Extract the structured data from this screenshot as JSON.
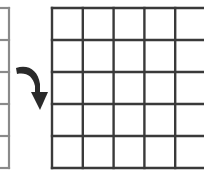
{
  "diagram": {
    "source_grid": {
      "visible_rows": 5,
      "color": "#8a8a8a",
      "partially_visible": true
    },
    "target_grid": {
      "rows": 5,
      "visible_columns": 5,
      "color": "#3a3a3a",
      "partially_visible": true
    },
    "arrow": {
      "icon": "curved-down-arrow-icon",
      "direction": "down",
      "color": "#2a2a2a"
    }
  }
}
